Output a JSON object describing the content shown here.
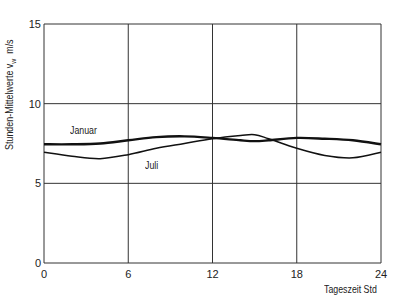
{
  "chart_data": {
    "type": "line",
    "title": "",
    "xlabel": "Tageszeit Std",
    "ylabel": "Stunden-Mittelwerte v_w m/s",
    "ylabel_main": "Stunden-Mittelwerte v",
    "ylabel_sub": "w",
    "ylabel_unit": "m/s",
    "xlim": [
      0,
      24
    ],
    "ylim": [
      0,
      15
    ],
    "xticks": [
      "0",
      "6",
      "12",
      "18",
      "24"
    ],
    "yticks": [
      "0",
      "5",
      "10",
      "15"
    ],
    "grid": true,
    "legend": "inline labels",
    "x": [
      0,
      2,
      4,
      6,
      8,
      10,
      12,
      14,
      15,
      16,
      18,
      20,
      22,
      24
    ],
    "series": [
      {
        "name": "Januar",
        "values": [
          7.45,
          7.45,
          7.5,
          7.7,
          7.9,
          7.95,
          7.85,
          7.7,
          7.65,
          7.7,
          7.85,
          7.8,
          7.7,
          7.45
        ]
      },
      {
        "name": "Juli",
        "values": [
          6.95,
          6.7,
          6.55,
          6.8,
          7.2,
          7.5,
          7.8,
          8.0,
          8.05,
          7.8,
          7.2,
          6.75,
          6.6,
          6.95
        ]
      }
    ]
  },
  "labels": {
    "januar": "Januar",
    "juli": "Juli"
  }
}
